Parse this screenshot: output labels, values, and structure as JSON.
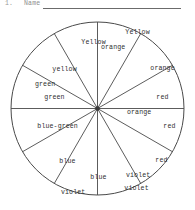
{
  "header": {
    "question_number": "1.",
    "name_label": "Name",
    "blank_rule": "answer-blank-line"
  },
  "wheel": {
    "title": "color-wheel",
    "sector_count": 12,
    "geometry": {
      "center_x": 97.5,
      "center_y": 94.5,
      "radius": 87,
      "spoke_step_degrees": 30,
      "first_spoke_degrees": 0
    },
    "colors": {
      "outline": "#4a4a4a",
      "spoke": "#4a4a4a",
      "hub": "#3a3a3a",
      "fill": "#ffffff",
      "text": "#2f2f2f"
    },
    "sectors": [
      {
        "name": "yellow-orange",
        "line1": "Yellow",
        "line2": "orange"
      },
      {
        "name": "orange",
        "line1": "orange",
        "line2": ""
      },
      {
        "name": "red-orange",
        "line1": "red",
        "line2": "orange"
      },
      {
        "name": "red",
        "line1": "red",
        "line2": ""
      },
      {
        "name": "red-violet",
        "line1": "red",
        "line2": "violet"
      },
      {
        "name": "violet",
        "line1": "violet",
        "line2": ""
      },
      {
        "name": "blue-violet",
        "line1": "blue",
        "line2": "violet"
      },
      {
        "name": "blue",
        "line1": "blue",
        "line2": ""
      },
      {
        "name": "blue-green",
        "line1": "blue-green",
        "line2": ""
      },
      {
        "name": "green",
        "line1": "green",
        "line2": ""
      },
      {
        "name": "yellow-green",
        "line1": "yellow",
        "line2": "green"
      },
      {
        "name": "yellow",
        "line1": "Yellow",
        "line2": ""
      }
    ]
  }
}
